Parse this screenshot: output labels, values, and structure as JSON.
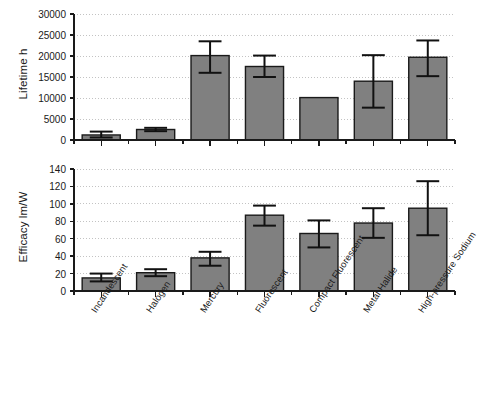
{
  "figure": {
    "background": "#ffffff",
    "bar_fill": "#808080",
    "bar_stroke": "#1a1a1a",
    "grid_color": "#b4b4b4",
    "axis_color": "#1a1a1a"
  },
  "chart_data": [
    {
      "type": "bar",
      "panel": "top",
      "title": "",
      "xlabel": "",
      "ylabel": "Lifetime h",
      "ylim": [
        0,
        30000
      ],
      "yticks": [
        0,
        5000,
        10000,
        15000,
        20000,
        25000,
        30000
      ],
      "ytick_labels": [
        "0",
        "5000",
        "10000",
        "15000",
        "20000",
        "25000",
        "30000"
      ],
      "grid": true,
      "legend": "none",
      "categories": [
        "Incandescent",
        "Halogen",
        "Mercury",
        "Fluorescent",
        "Compact Fluorescent",
        "Metal Halide",
        "High-pressure Sodium"
      ],
      "values": [
        1200,
        2500,
        20100,
        17500,
        10100,
        14000,
        19700
      ],
      "error_low": [
        600,
        2100,
        16000,
        15000,
        null,
        7700,
        15200
      ],
      "error_high": [
        2000,
        2900,
        23500,
        20100,
        null,
        20200,
        23700
      ]
    },
    {
      "type": "bar",
      "panel": "bottom",
      "title": "",
      "xlabel": "",
      "ylabel": "Efficacy lm/W",
      "ylim": [
        0,
        140
      ],
      "yticks": [
        0,
        20,
        40,
        60,
        80,
        100,
        120,
        140
      ],
      "ytick_labels": [
        "0",
        "20",
        "40",
        "60",
        "80",
        "100",
        "120",
        "140"
      ],
      "grid": true,
      "legend": "none",
      "categories": [
        "Incandescent",
        "Halogen",
        "Mercury",
        "Fluorescent",
        "Compact Fluorescent",
        "Metal Halide",
        "High-pressure Sodium"
      ],
      "values": [
        15,
        21,
        38,
        87,
        66,
        78,
        95
      ],
      "error_low": [
        11,
        17,
        29,
        75,
        50,
        61,
        64
      ],
      "error_high": [
        20,
        25,
        45,
        98,
        81,
        95,
        126
      ]
    }
  ]
}
